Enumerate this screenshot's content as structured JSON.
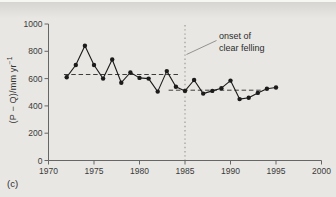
{
  "panel": {
    "label": "(c)"
  },
  "chart_data": {
    "type": "line",
    "title": "",
    "xlabel": "",
    "ylabel_main": "(P − Q)/mm yr",
    "ylabel_sup": "−1",
    "series_name": "annual (P − Q)",
    "x": [
      1972,
      1973,
      1974,
      1975,
      1976,
      1977,
      1978,
      1979,
      1980,
      1981,
      1982,
      1983,
      1984,
      1985,
      1986,
      1987,
      1988,
      1989,
      1990,
      1991,
      1992,
      1993,
      1994,
      1995
    ],
    "values": [
      610,
      700,
      840,
      700,
      600,
      740,
      570,
      645,
      605,
      600,
      505,
      655,
      540,
      510,
      590,
      490,
      510,
      530,
      585,
      450,
      460,
      495,
      525,
      535
    ],
    "xlim": [
      1970,
      2000
    ],
    "ylim": [
      0,
      1000
    ],
    "xticks": [
      1970,
      1975,
      1980,
      1985,
      1990,
      1995,
      2000
    ],
    "yticks": [
      0,
      200,
      400,
      600,
      800,
      1000
    ],
    "grid": false,
    "legend": false,
    "mean_lines": [
      {
        "value": 630,
        "x_start": 1971.7,
        "x_end": 1984.3,
        "style": "dashed"
      },
      {
        "value": 515,
        "x_start": 1983.2,
        "x_end": 1993.4,
        "style": "dashed"
      }
    ],
    "event_line": {
      "x": 1985,
      "style": "dotted",
      "label": "onset of\nclear felling"
    },
    "colors": {
      "series": "#1b1b1b",
      "axis": "#666666",
      "mean_line": "#3d3d3d",
      "event_line": "#979590",
      "leader_line": "#8a8885",
      "text": "#333333",
      "background": "#e8e7e3"
    }
  }
}
